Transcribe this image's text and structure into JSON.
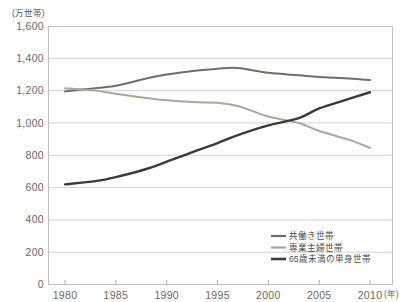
{
  "chart_data": {
    "type": "line",
    "title": "",
    "xlabel": "(年)",
    "ylabel": "(万世帯)",
    "xlim": [
      1980,
      2010
    ],
    "ylim": [
      0,
      1600
    ],
    "grid": true,
    "legend_position": "bottom-right",
    "x": [
      1980,
      1985,
      1990,
      1995,
      2000,
      2005,
      2010
    ],
    "xtick_labels": [
      "1980",
      "1985",
      "1990",
      "1995",
      "2000",
      "2005",
      "2010"
    ],
    "ytick_labels": [
      "0",
      "200",
      "400",
      "600",
      "800",
      "1,000",
      "1,200",
      "1,400",
      "1,600"
    ],
    "ytick_values": [
      0,
      200,
      400,
      600,
      800,
      1000,
      1200,
      1400,
      1600
    ],
    "series": [
      {
        "name": "共働き世帯",
        "color": "#6f6f66",
        "width": 2.0,
        "values": [
          1195,
          1230,
          1300,
          1335,
          1310,
          1285,
          1265
        ],
        "points": [
          {
            "x": 1980,
            "y": 1195
          },
          {
            "x": 1982,
            "y": 1208
          },
          {
            "x": 1985,
            "y": 1230
          },
          {
            "x": 1988,
            "y": 1275
          },
          {
            "x": 1990,
            "y": 1300
          },
          {
            "x": 1993,
            "y": 1325
          },
          {
            "x": 1995,
            "y": 1335
          },
          {
            "x": 1997,
            "y": 1340
          },
          {
            "x": 2000,
            "y": 1310
          },
          {
            "x": 2003,
            "y": 1295
          },
          {
            "x": 2005,
            "y": 1285
          },
          {
            "x": 2008,
            "y": 1275
          },
          {
            "x": 2010,
            "y": 1265
          }
        ]
      },
      {
        "name": "専業主婦世帯",
        "color": "#a7a79c",
        "width": 2.0,
        "values": [
          1215,
          1180,
          1140,
          1125,
          1040,
          950,
          845
        ],
        "points": [
          {
            "x": 1980,
            "y": 1215
          },
          {
            "x": 1983,
            "y": 1200
          },
          {
            "x": 1985,
            "y": 1180
          },
          {
            "x": 1988,
            "y": 1155
          },
          {
            "x": 1990,
            "y": 1140
          },
          {
            "x": 1993,
            "y": 1128
          },
          {
            "x": 1995,
            "y": 1125
          },
          {
            "x": 1997,
            "y": 1105
          },
          {
            "x": 2000,
            "y": 1040
          },
          {
            "x": 2003,
            "y": 1000
          },
          {
            "x": 2005,
            "y": 950
          },
          {
            "x": 2008,
            "y": 895
          },
          {
            "x": 2010,
            "y": 845
          }
        ]
      },
      {
        "name": "65歳未満の単身世帯",
        "color": "#3b3b36",
        "width": 2.4,
        "values": [
          620,
          665,
          760,
          875,
          985,
          1090,
          1190
        ],
        "points": [
          {
            "x": 1980,
            "y": 620
          },
          {
            "x": 1983,
            "y": 640
          },
          {
            "x": 1985,
            "y": 665
          },
          {
            "x": 1988,
            "y": 715
          },
          {
            "x": 1990,
            "y": 760
          },
          {
            "x": 1993,
            "y": 830
          },
          {
            "x": 1995,
            "y": 875
          },
          {
            "x": 1997,
            "y": 925
          },
          {
            "x": 2000,
            "y": 985
          },
          {
            "x": 2003,
            "y": 1030
          },
          {
            "x": 2005,
            "y": 1090
          },
          {
            "x": 2008,
            "y": 1150
          },
          {
            "x": 2010,
            "y": 1190
          }
        ]
      }
    ]
  },
  "axes": {
    "y_unit_label": "(万世帯)",
    "x_unit_label": "(年)"
  },
  "legend": {
    "items": [
      {
        "label": "共働き世帯",
        "color": "#6f6f66"
      },
      {
        "label": "専業主婦世帯",
        "color": "#a7a79c"
      },
      {
        "label": "65歳未満の単身世帯",
        "color": "#3b3b36"
      }
    ]
  }
}
